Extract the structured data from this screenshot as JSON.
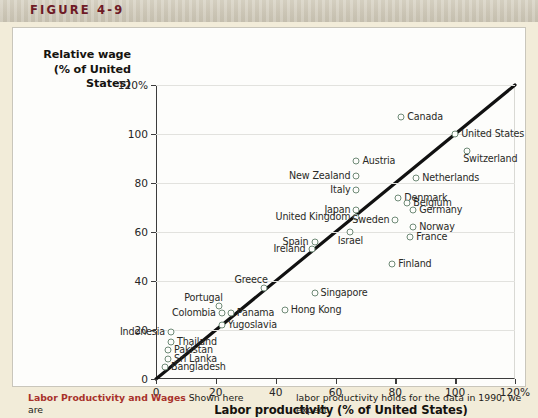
{
  "figure": {
    "label": "FIGURE 4-9",
    "accent_color": "#6e1b26",
    "panel_background": "#fdfdfb",
    "page_background": "#f2ecd9"
  },
  "caption": {
    "title": "Labor Productivity and Wages",
    "left_text": " Shown here are",
    "right_text": "labor productivity holds for the data in 1990, we expect"
  },
  "chart_data": {
    "type": "scatter",
    "title": "",
    "xlabel": "Labor productivity (% of United States)",
    "ylabel": "Relative wage (% of United States)",
    "ylabel_lines": [
      "Relative wage",
      "(% of United",
      "States)"
    ],
    "xlim": [
      0,
      120
    ],
    "ylim": [
      0,
      120
    ],
    "xticks": [
      0,
      20,
      40,
      60,
      80,
      100,
      120
    ],
    "yticks": [
      0,
      20,
      40,
      60,
      80,
      100,
      120
    ],
    "xtick_labels": [
      "0",
      "20",
      "40",
      "60",
      "80",
      "100",
      "120%"
    ],
    "ytick_labels": [
      "0",
      "20",
      "40",
      "60",
      "80",
      "100",
      "120%"
    ],
    "grid": "horizontal",
    "legend": "none",
    "marker_color": "#6f8a77",
    "line": {
      "name": "45-degree line",
      "from": [
        0,
        0
      ],
      "to": [
        120,
        120
      ],
      "color": "#111111"
    },
    "points": [
      {
        "name": "Canada",
        "x": 82,
        "y": 107,
        "label_side": "right"
      },
      {
        "name": "United States",
        "x": 100,
        "y": 100,
        "label_side": "right"
      },
      {
        "name": "Switzerland",
        "x": 104,
        "y": 93,
        "label_side": "right-below"
      },
      {
        "name": "Austria",
        "x": 67,
        "y": 89,
        "label_side": "right"
      },
      {
        "name": "New Zealand",
        "x": 67,
        "y": 83,
        "label_side": "left"
      },
      {
        "name": "Netherlands",
        "x": 87,
        "y": 82,
        "label_side": "right"
      },
      {
        "name": "Italy",
        "x": 67,
        "y": 77,
        "label_side": "left"
      },
      {
        "name": "Denmark",
        "x": 81,
        "y": 74,
        "label_side": "right"
      },
      {
        "name": "Belgium",
        "x": 84,
        "y": 72,
        "label_side": "right"
      },
      {
        "name": "Germany",
        "x": 86,
        "y": 69,
        "label_side": "right"
      },
      {
        "name": "Japan",
        "x": 67,
        "y": 69,
        "label_side": "left"
      },
      {
        "name": "United Kingdom",
        "x": 67,
        "y": 66,
        "label_side": "left"
      },
      {
        "name": "Sweden",
        "x": 80,
        "y": 65,
        "label_side": "left"
      },
      {
        "name": "Norway",
        "x": 86,
        "y": 62,
        "label_side": "right"
      },
      {
        "name": "Israel",
        "x": 65,
        "y": 60,
        "label_side": "below"
      },
      {
        "name": "France",
        "x": 85,
        "y": 58,
        "label_side": "right"
      },
      {
        "name": "Spain",
        "x": 53,
        "y": 56,
        "label_side": "left"
      },
      {
        "name": "Ireland",
        "x": 52,
        "y": 53,
        "label_side": "left"
      },
      {
        "name": "Finland",
        "x": 79,
        "y": 47,
        "label_side": "right"
      },
      {
        "name": "Greece",
        "x": 36,
        "y": 37,
        "label_side": "above-left"
      },
      {
        "name": "Singapore",
        "x": 53,
        "y": 35,
        "label_side": "right"
      },
      {
        "name": "Portugal",
        "x": 21,
        "y": 30,
        "label_side": "above-left"
      },
      {
        "name": "Colombia",
        "x": 22,
        "y": 27,
        "label_side": "left"
      },
      {
        "name": "Panama",
        "x": 25,
        "y": 27,
        "label_side": "right"
      },
      {
        "name": "Hong Kong",
        "x": 43,
        "y": 28,
        "label_side": "right"
      },
      {
        "name": "Yugoslavia",
        "x": 22,
        "y": 22,
        "label_side": "right"
      },
      {
        "name": "Indonesia",
        "x": 5,
        "y": 19,
        "label_side": "left"
      },
      {
        "name": "Thailand",
        "x": 5,
        "y": 15,
        "label_side": "right"
      },
      {
        "name": "Pakistan",
        "x": 4,
        "y": 12,
        "label_side": "right"
      },
      {
        "name": "Sri Lanka",
        "x": 4,
        "y": 8,
        "label_side": "right"
      },
      {
        "name": "Bangladesh",
        "x": 3,
        "y": 5,
        "label_side": "right"
      }
    ]
  }
}
